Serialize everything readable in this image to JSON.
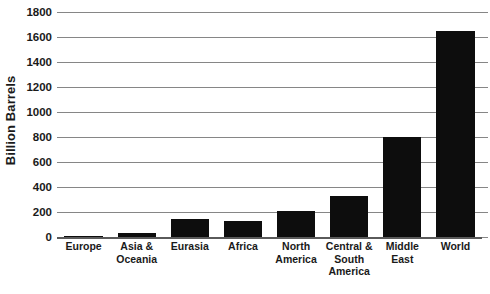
{
  "chart_data": {
    "type": "bar",
    "title": "",
    "xlabel": "",
    "ylabel": "Billion Barrels",
    "ylim": [
      0,
      1800
    ],
    "ytick_step": 200,
    "yticks": [
      1800,
      1600,
      1400,
      1200,
      1000,
      800,
      600,
      400,
      200,
      0
    ],
    "ytick_labels": [
      "1800",
      "1600",
      "1400",
      "1200",
      "1000",
      "800",
      "600",
      "400",
      "200",
      "0"
    ],
    "grid": true,
    "legend": "none",
    "bar_color": "#0d0d0d",
    "gridline_color": "#868686",
    "categories": [
      "Europe",
      "Asia & Oceania",
      "Eurasia",
      "Africa",
      "North America",
      "Central & South America",
      "Middle East",
      "World"
    ],
    "category_label_lines": [
      [
        "Europe"
      ],
      [
        "Asia &",
        "Oceania"
      ],
      [
        "Eurasia"
      ],
      [
        "Africa"
      ],
      [
        "North",
        "America"
      ],
      [
        "Central &",
        "South",
        "America"
      ],
      [
        "Middle",
        "East"
      ],
      [
        "World"
      ]
    ],
    "values": [
      12,
      35,
      145,
      125,
      210,
      330,
      800,
      1650
    ]
  }
}
